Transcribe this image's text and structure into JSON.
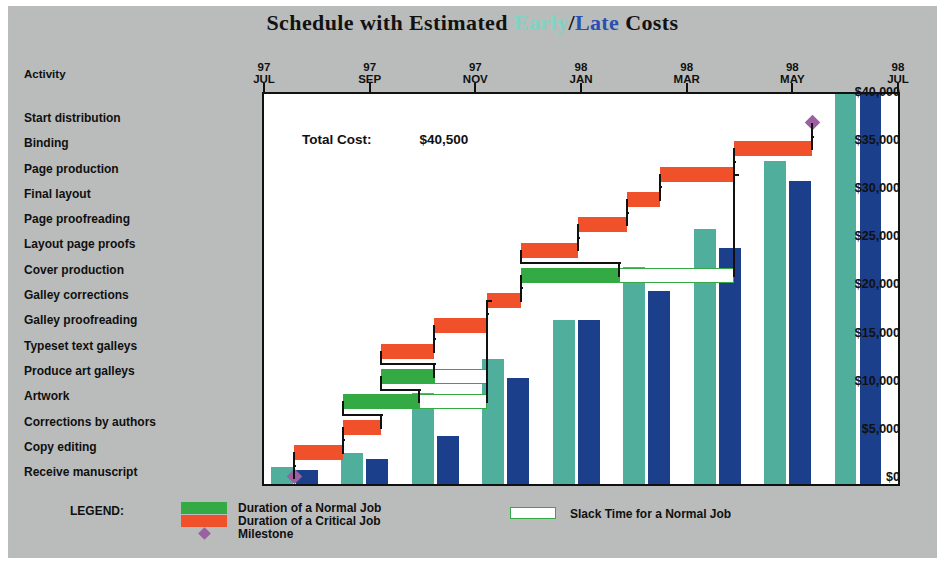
{
  "title": {
    "prefix": "Schedule with Estimated ",
    "early": "Early",
    "separator": "/",
    "late": "Late",
    "suffix": " Costs"
  },
  "activity_header": "Activity",
  "total_cost": {
    "label": "Total Cost:",
    "value": "$40,500"
  },
  "activities": [
    "Start distribution",
    "Binding",
    "Page production",
    "Final layout",
    "Page proofreading",
    "Layout page proofs",
    "Cover production",
    "Galley corrections",
    "Galley proofreading",
    "Typeset text galleys",
    "Produce art galleys",
    "Artwork",
    "Corrections by authors",
    "Copy editing",
    "Receive manuscript"
  ],
  "legend": {
    "title": "LEGEND:",
    "normal": "Duration of a Normal Job",
    "critical": "Duration of a Critical Job",
    "milestone": "Milestone",
    "slack": "Slack Time for a Normal Job"
  },
  "colors": {
    "panel": "#b9bcbb",
    "normal_job": "#33aa44",
    "critical_job": "#f0502a",
    "slack": "#ffffff",
    "milestone": "#9c5fa0",
    "early_cost": "#4fae9c",
    "late_cost": "#1b3f8b",
    "title_early": "#7fd4c4",
    "title_late": "#2a4fb0"
  },
  "chart_data": {
    "type": "bar",
    "title": "Schedule with Estimated Early/Late Costs",
    "xlabel": "",
    "ylabel": "",
    "ylim": [
      0,
      40500
    ],
    "grid": false,
    "legend_position": "bottom",
    "y_ticks": [
      "$0",
      "$5,000",
      "$10,000",
      "$15,000",
      "$20,000",
      "$25,000",
      "$30,000",
      "$35,000",
      "$40,000"
    ],
    "y_tick_values": [
      0,
      5000,
      10000,
      15000,
      20000,
      25000,
      30000,
      35000,
      40000
    ],
    "x_ticks": [
      {
        "year": "97",
        "month": "JUL"
      },
      {
        "year": "97",
        "month": "SEP"
      },
      {
        "year": "97",
        "month": "NOV"
      },
      {
        "year": "98",
        "month": "JAN"
      },
      {
        "year": "98",
        "month": "MAR"
      },
      {
        "year": "98",
        "month": "MAY"
      },
      {
        "year": "98",
        "month": "JUL"
      }
    ],
    "categories": [
      "97 JUL",
      "97 SEP",
      "97 NOV",
      "98 JAN",
      "98 MAR",
      "98 MAY",
      "98 JUL",
      "98 SEP",
      "98 NOV"
    ],
    "series": [
      {
        "name": "Early",
        "color": "#4fae9c",
        "values": [
          1800,
          3200,
          9500,
          13000,
          17000,
          22500,
          26500,
          33500,
          40500
        ]
      },
      {
        "name": "Late",
        "color": "#1b3f8b",
        "values": [
          1500,
          2600,
          5000,
          11000,
          17000,
          20000,
          24500,
          31500,
          40500
        ]
      }
    ],
    "annotations": [
      {
        "text": "Total Cost:",
        "value": "$40,500"
      }
    ],
    "gantt_tasks": [
      {
        "activity": "Start distribution",
        "kind": "milestone",
        "start": 0.865,
        "end": 0.865
      },
      {
        "activity": "Binding",
        "kind": "critical",
        "start": 0.742,
        "end": 0.865,
        "slack": 0
      },
      {
        "activity": "Page production",
        "kind": "critical",
        "start": 0.625,
        "end": 0.742,
        "slack": 0
      },
      {
        "activity": "Final layout",
        "kind": "critical",
        "start": 0.573,
        "end": 0.625,
        "slack": 0
      },
      {
        "activity": "Page proofreading",
        "kind": "critical",
        "start": 0.495,
        "end": 0.573,
        "slack": 0
      },
      {
        "activity": "Layout page proofs",
        "kind": "critical",
        "start": 0.405,
        "end": 0.495,
        "slack": 0
      },
      {
        "activity": "Cover production",
        "kind": "normal",
        "start": 0.405,
        "end": 0.56,
        "slack_end": 0.742
      },
      {
        "activity": "Galley corrections",
        "kind": "critical",
        "start": 0.352,
        "end": 0.405,
        "slack": 0
      },
      {
        "activity": "Galley proofreading",
        "kind": "critical",
        "start": 0.268,
        "end": 0.352,
        "slack": 0
      },
      {
        "activity": "Typeset text galleys",
        "kind": "critical",
        "start": 0.185,
        "end": 0.268,
        "slack": 0
      },
      {
        "activity": "Produce art galleys",
        "kind": "normal",
        "start": 0.185,
        "end": 0.268,
        "slack_end": 0.352
      },
      {
        "activity": "Artwork",
        "kind": "normal",
        "start": 0.125,
        "end": 0.245,
        "slack_end": 0.352
      },
      {
        "activity": "Corrections by authors",
        "kind": "critical",
        "start": 0.125,
        "end": 0.185,
        "slack": 0
      },
      {
        "activity": "Copy editing",
        "kind": "critical",
        "start": 0.048,
        "end": 0.125,
        "slack": 0
      },
      {
        "activity": "Receive manuscript",
        "kind": "milestone",
        "start": 0.048,
        "end": 0.048
      }
    ]
  }
}
